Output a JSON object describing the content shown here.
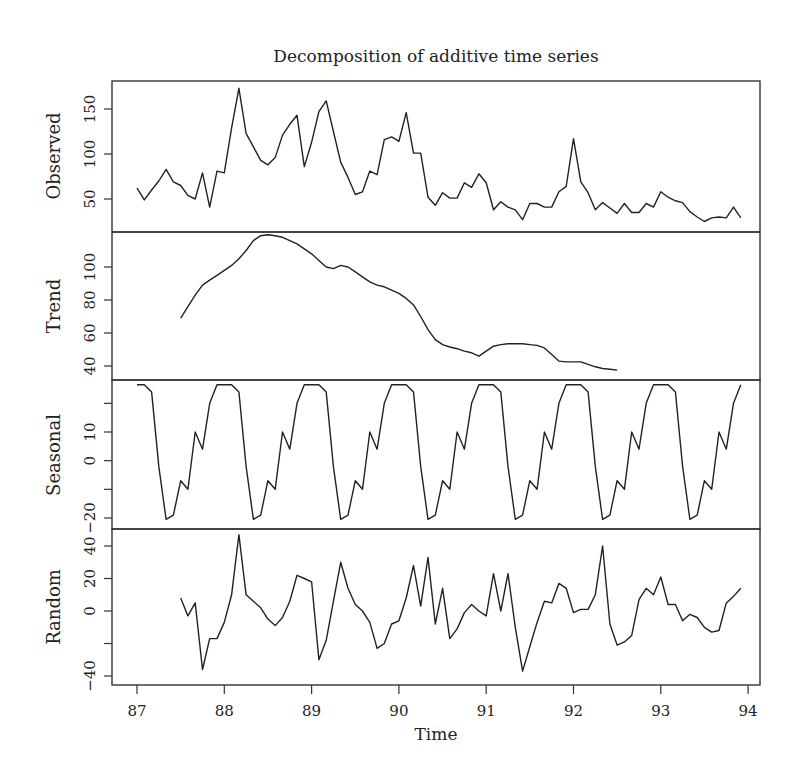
{
  "chart_data": {
    "type": "line",
    "title": "Decomposition of additive time series",
    "xlabel": "Time",
    "x_ticks": [
      87,
      88,
      89,
      90,
      91,
      92,
      93,
      94
    ],
    "xlim": [
      86.75,
      94.2
    ],
    "frequency": 12,
    "panels": [
      {
        "name": "Observed",
        "ylabel": "Observed",
        "y_ticks": [
          50,
          100,
          150
        ],
        "ylim": [
          20,
          180
        ],
        "start": 87.0,
        "values": [
          62,
          49,
          60,
          70,
          83,
          69,
          65,
          54,
          50,
          79,
          41,
          81,
          79,
          129,
          173,
          123,
          108,
          93,
          88,
          96,
          121,
          133,
          143,
          86,
          113,
          147,
          159,
          125,
          91,
          74,
          55,
          58,
          81,
          77,
          116,
          119,
          114,
          146,
          101,
          101,
          52,
          43,
          57,
          51,
          51,
          68,
          63,
          78,
          68,
          38,
          47,
          41,
          38,
          27,
          45,
          45,
          41,
          41,
          58,
          64,
          117,
          69,
          57,
          38,
          46,
          40,
          34,
          45,
          35,
          35,
          45,
          41,
          58,
          52,
          48,
          46,
          36,
          30,
          25,
          29,
          30,
          29,
          41,
          29
        ]
      },
      {
        "name": "Trend",
        "ylabel": "Trend",
        "y_ticks": [
          40,
          60,
          80,
          100
        ],
        "ylim": [
          35,
          120
        ],
        "start": 87.5,
        "values": [
          69,
          76,
          83,
          89,
          92,
          95,
          98,
          101,
          105,
          110,
          116,
          119,
          119.5,
          119,
          118,
          116,
          114,
          111,
          108,
          104,
          100,
          99,
          101,
          100,
          97,
          94,
          91,
          89,
          88,
          86,
          84,
          81,
          77,
          70,
          62,
          56,
          53,
          51.5,
          50.5,
          49,
          48,
          46,
          49,
          52,
          53,
          53.5,
          53.5,
          53.5,
          53,
          52.5,
          51,
          47,
          43,
          42.5,
          42.5,
          42.5,
          41,
          39.5,
          38.5,
          38,
          37.5
        ]
      },
      {
        "name": "Seasonal",
        "ylabel": "Seasonal",
        "y_ticks": [
          -20,
          0,
          10
        ],
        "y_ticks_minor": [
          -10,
          20
        ],
        "ylim": [
          -23,
          28
        ],
        "start": 87.0,
        "pattern": [
          26.5,
          26.5,
          24,
          -2,
          -20.5,
          -19,
          -7,
          -10,
          10,
          4,
          20,
          26.5
        ],
        "values_note": "12-month repeating pattern, 84 months"
      },
      {
        "name": "Random",
        "ylabel": "Random",
        "y_ticks": [
          -40,
          0,
          20,
          40
        ],
        "y_ticks_minor": [
          -20
        ],
        "ylim": [
          -42,
          50
        ],
        "start": 87.5,
        "values": [
          8,
          -3,
          5,
          -36,
          -17,
          -17,
          -7,
          10,
          47,
          10,
          6,
          2,
          -5,
          -9,
          -4,
          6,
          22,
          20,
          18,
          -30,
          -18,
          6,
          30,
          14,
          4,
          0,
          -7,
          -23,
          -20,
          -8,
          -6,
          8,
          28,
          3,
          33,
          -8,
          14,
          -17,
          -11,
          -1,
          4,
          0,
          -3,
          23,
          0,
          23,
          -10,
          -37,
          -22,
          -7,
          6,
          5,
          17,
          14,
          -1,
          1,
          1,
          10,
          40,
          -8,
          -21,
          -19,
          -15,
          7,
          14,
          10,
          21,
          4,
          4,
          -6,
          -2,
          -4,
          -10,
          -13,
          -12,
          5,
          9,
          14
        ]
      }
    ],
    "grid": false,
    "legend": null
  }
}
